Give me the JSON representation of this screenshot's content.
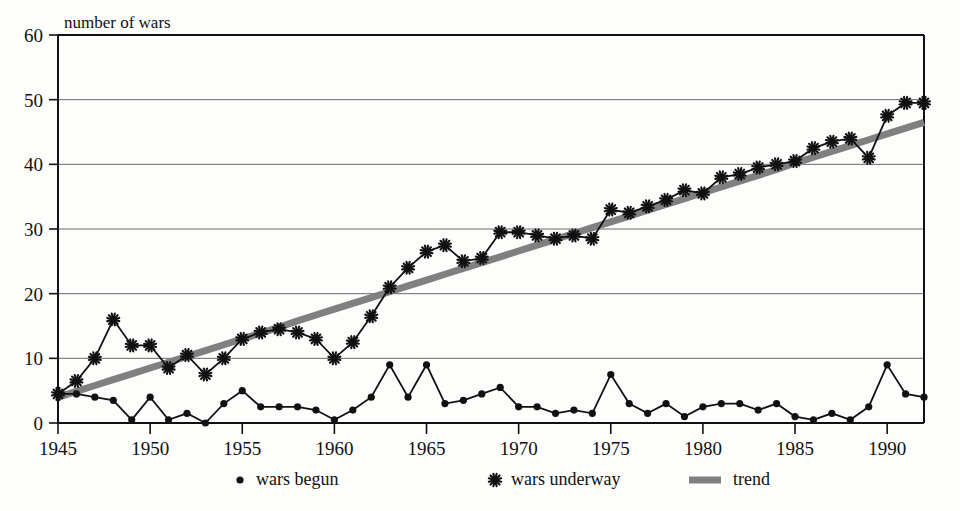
{
  "chart_data": {
    "type": "line",
    "title": "",
    "ylabel": "number of wars",
    "xlabel": "",
    "xlim": [
      1945,
      1992
    ],
    "ylim": [
      0,
      60
    ],
    "ytick_step": 10,
    "xtick_step": 5,
    "grid": true,
    "legend_position": "bottom",
    "yticks": [
      "0",
      "10",
      "20",
      "30",
      "40",
      "50",
      "60"
    ],
    "xticks": [
      "1945",
      "1950",
      "1955",
      "1960",
      "1965",
      "1970",
      "1975",
      "1980",
      "1985",
      "1990"
    ],
    "x": [
      1945,
      1946,
      1947,
      1948,
      1949,
      1950,
      1951,
      1952,
      1953,
      1954,
      1955,
      1956,
      1957,
      1958,
      1959,
      1960,
      1961,
      1962,
      1963,
      1964,
      1965,
      1966,
      1967,
      1968,
      1969,
      1970,
      1971,
      1972,
      1973,
      1974,
      1975,
      1976,
      1977,
      1978,
      1979,
      1980,
      1981,
      1982,
      1983,
      1984,
      1985,
      1986,
      1987,
      1988,
      1989,
      1990,
      1991,
      1992
    ],
    "series": [
      {
        "name": "wars begun",
        "marker": "dot",
        "color": "#111111",
        "values": [
          4.5,
          4.5,
          4.0,
          3.5,
          0.5,
          4.0,
          0.5,
          1.5,
          0.0,
          3.0,
          5.0,
          2.5,
          2.5,
          2.5,
          2.0,
          0.5,
          2.0,
          4.0,
          9.0,
          4.0,
          9.0,
          3.0,
          3.5,
          4.5,
          5.5,
          2.5,
          2.5,
          1.5,
          2.0,
          1.5,
          7.5,
          3.0,
          1.5,
          3.0,
          1.0,
          2.5,
          3.0,
          3.0,
          2.0,
          3.0,
          1.0,
          0.5,
          1.5,
          0.5,
          2.5,
          9.0,
          4.5,
          4.0
        ]
      },
      {
        "name": "wars underway",
        "marker": "asterisk",
        "color": "#111111",
        "values": [
          4.5,
          6.5,
          10.0,
          16.0,
          12.0,
          12.0,
          8.5,
          10.5,
          7.5,
          10.0,
          13.0,
          14.0,
          14.5,
          14.0,
          13.0,
          10.0,
          12.5,
          16.5,
          21.0,
          24.0,
          26.5,
          27.5,
          25.0,
          25.5,
          29.5,
          29.5,
          29.0,
          28.5,
          29.0,
          28.5,
          33.0,
          32.5,
          33.5,
          34.5,
          36.0,
          35.5,
          38.0,
          38.5,
          39.5,
          40.0,
          40.5,
          42.5,
          43.5,
          44.0,
          41.0,
          47.5,
          49.5,
          49.5
        ]
      },
      {
        "name": "trend",
        "marker": "line",
        "color": "#808080",
        "values": [
          4.0,
          4.9,
          5.8,
          6.7,
          7.6,
          8.5,
          9.4,
          10.3,
          11.2,
          12.1,
          13.0,
          13.9,
          14.8,
          15.8,
          16.7,
          17.6,
          18.5,
          19.4,
          20.3,
          21.2,
          22.1,
          23.0,
          23.9,
          24.8,
          25.7,
          26.6,
          27.5,
          28.4,
          29.3,
          30.2,
          31.1,
          32.0,
          32.9,
          33.8,
          34.7,
          35.6,
          36.5,
          37.4,
          38.3,
          39.2,
          40.2,
          41.1,
          42.0,
          42.9,
          43.8,
          44.7,
          45.6,
          46.5
        ]
      }
    ],
    "legend": [
      {
        "label": "wars begun",
        "marker": "dot"
      },
      {
        "label": "wars underway",
        "marker": "asterisk"
      },
      {
        "label": "trend",
        "marker": "line"
      }
    ]
  }
}
